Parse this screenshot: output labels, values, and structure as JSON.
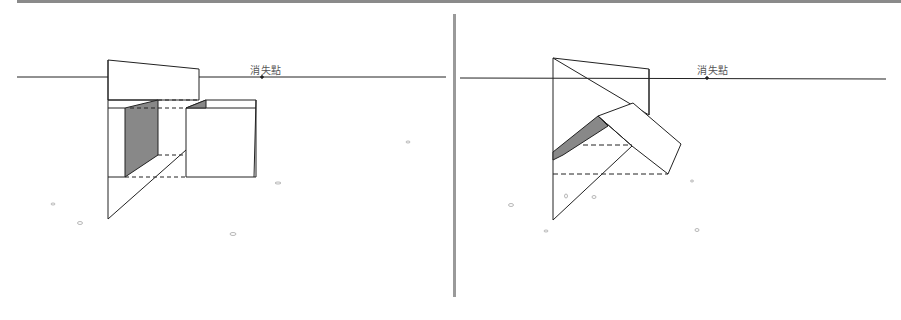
{
  "diagram": {
    "colors": {
      "line": "#222222",
      "shade": "#888888",
      "divider": "#9a9a9a",
      "top_rule": "#8a8a8a",
      "label": "#555555"
    },
    "panels": [
      {
        "id": "left",
        "vanishing_point_label": "消失點",
        "vanishing_point": {
          "x": 262,
          "y": 77
        },
        "horizon_y": 77,
        "subject": "box behind picture plane with shaded side face"
      },
      {
        "id": "right",
        "vanishing_point_label": "消失點",
        "vanishing_point": {
          "x": 707,
          "y": 78
        },
        "horizon_y": 78,
        "subject": "tilted roof-like prism behind picture plane with shaded face"
      }
    ]
  }
}
